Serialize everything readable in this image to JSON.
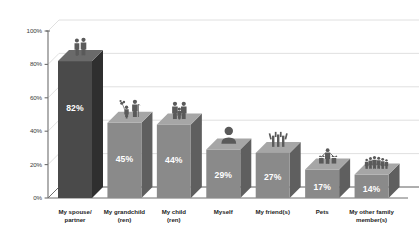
{
  "chart_data": {
    "type": "bar",
    "title": "",
    "subtitle": "",
    "xlabel": "",
    "ylabel": "",
    "ylim": [
      0,
      100
    ],
    "ytick_labels": [
      "0%",
      "20%",
      "40%",
      "60%",
      "80%",
      "100%"
    ],
    "ytick_values": [
      0,
      20,
      40,
      60,
      80,
      100
    ],
    "grid": true,
    "legend": "none",
    "style": "3d-bar-grayscale-with-pictograms",
    "categories": [
      "My spouse/\npartner",
      "My grandchild\n(ren)",
      "My child\n(ren)",
      "Myself",
      "My friend(s)",
      "Pets",
      "My other family\nmember(s)"
    ],
    "values": [
      82,
      45,
      44,
      29,
      27,
      17,
      14
    ],
    "value_labels": [
      "82%",
      "45%",
      "44%",
      "29%",
      "27%",
      "17%",
      "14%"
    ],
    "icons": [
      "couple-icon",
      "grandparent-grandchild-balloon-icon",
      "parent-child-icon",
      "single-person-bust-icon",
      "three-friends-raised-arms-icon",
      "person-with-pets-icon",
      "family-group-icon"
    ],
    "colors": {
      "bar_front_primary": "#4a4a4a",
      "bar_side_primary": "#2f2f2f",
      "bar_top_primary": "#6a6a6a",
      "bar_front_secondary": "#8a8a8a",
      "bar_side_secondary": "#5f5f5f",
      "bar_top_secondary": "#a6a6a6",
      "value_text": "#ffffff",
      "axis": "#6e6e6e",
      "gridline": "#dcdcdc",
      "background": "#ffffff"
    }
  }
}
